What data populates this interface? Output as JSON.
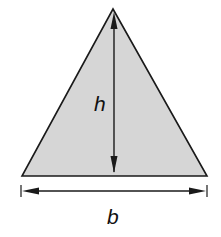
{
  "diagram": {
    "type": "triangle-area-dimension",
    "shape": "triangle",
    "fill_color": "#d6d6d6",
    "stroke_color": "#1a1a1a",
    "labels": {
      "height": "h",
      "base": "b"
    },
    "annotations": [
      {
        "name": "height-arrow",
        "label": "h",
        "direction": "vertical",
        "double_headed": true
      },
      {
        "name": "base-dimension-arrow",
        "label": "b",
        "direction": "horizontal",
        "double_headed": true
      }
    ]
  }
}
